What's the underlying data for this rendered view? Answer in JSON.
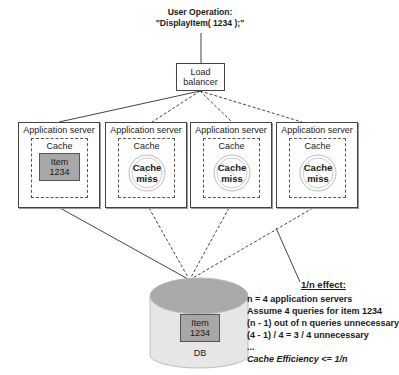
{
  "diagram": {
    "title_line1": "User Operation:",
    "title_line2": "\"DisplayItem( 1234 );\"",
    "load_balancer": {
      "line1": "Load",
      "line2": "balancer"
    },
    "servers": [
      {
        "name": "Application server",
        "cache_label": "Cache",
        "state": "hit",
        "item_line1": "Item",
        "item_line2": "1234"
      },
      {
        "name": "Application server",
        "cache_label": "Cache",
        "state": "miss",
        "miss_line1": "Cache",
        "miss_line2": "miss"
      },
      {
        "name": "Application server",
        "cache_label": "Cache",
        "state": "miss",
        "miss_line1": "Cache",
        "miss_line2": "miss"
      },
      {
        "name": "Application server",
        "cache_label": "Cache",
        "state": "miss",
        "miss_line1": "Cache",
        "miss_line2": "miss"
      }
    ],
    "db": {
      "item_line1": "Item",
      "item_line2": "1234",
      "label": "DB"
    },
    "effect": {
      "title": "1/n effect:",
      "lines": [
        "n = 4 application servers",
        "Assume 4 queries for item 1234",
        "(n - 1) out of n queries unnecessary",
        "(4 - 1) / 4 = 3 / 4 unnecessary",
        "...",
        "Cache Efficiency <= 1/n"
      ]
    },
    "colors": {
      "item_fill": "#a7a7a7",
      "db_top": "#a9a9a9",
      "db_body": "#e6e6e6",
      "stroke": "#444444"
    }
  }
}
